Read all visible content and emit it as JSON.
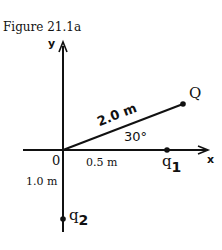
{
  "figure": {
    "caption": "Figure 21.1a",
    "axes": {
      "x_label": "x",
      "y_label": "y",
      "origin_label": "0"
    },
    "segments": {
      "oq_length": "2.0 m",
      "angle": "30°",
      "q1_distance": "0.5 m",
      "q2_distance": "1.0 m"
    },
    "points": {
      "Q": "Q",
      "q1_letter": "q",
      "q1_sub": "1",
      "q2_letter": "q",
      "q2_sub": "2"
    }
  }
}
